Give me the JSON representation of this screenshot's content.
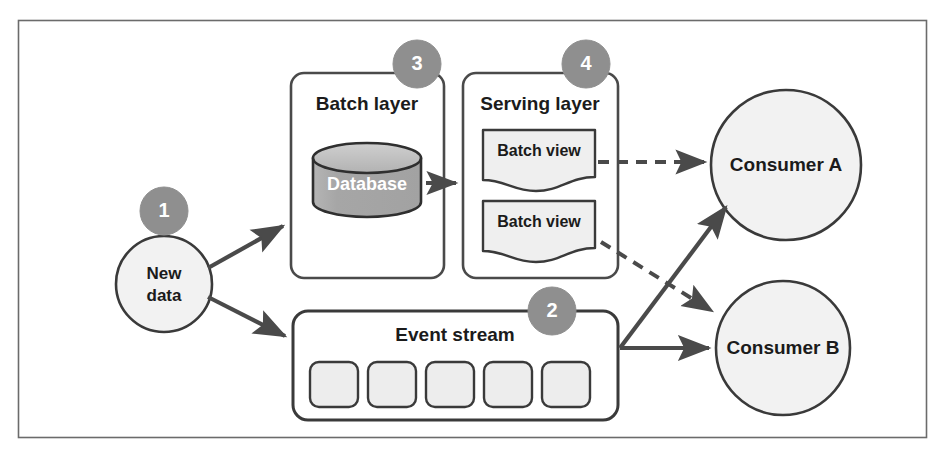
{
  "figure": {
    "type": "architecture-diagram",
    "frame_border_color": "#555555",
    "background_color": "#ffffff"
  },
  "colors": {
    "stroke_dark": "#3a3a3a",
    "stroke_medium": "#555555",
    "badge_fill": "#8f8f8f",
    "badge_text": "#ffffff",
    "database_fill": "#a8a8a8",
    "database_top_fill": "#bdbdbd",
    "database_text": "#ffffff",
    "view_fill": "#efefef",
    "event_box_fill": "#ededed",
    "consumer_fill": "#f2f2f2",
    "new_data_fill": "#f2f2f2",
    "arrow_color": "#4a4a4a",
    "label_text": "#1b1b1b"
  },
  "badges": [
    {
      "id": "badge-1",
      "number": "1",
      "target": "new-data"
    },
    {
      "id": "badge-2",
      "number": "2",
      "target": "event-stream"
    },
    {
      "id": "badge-3",
      "number": "3",
      "target": "batch-layer"
    },
    {
      "id": "badge-4",
      "number": "4",
      "target": "serving-layer"
    }
  ],
  "nodes": {
    "new_data": {
      "label_line1": "New",
      "label_line2": "data",
      "shape": "circle"
    },
    "batch_layer": {
      "title": "Batch layer",
      "shape": "rounded-rect",
      "database": {
        "label": "Database",
        "shape": "cylinder"
      }
    },
    "serving_layer": {
      "title": "Serving layer",
      "shape": "rounded-rect",
      "views": [
        {
          "label": "Batch view",
          "shape": "wavy-document"
        },
        {
          "label": "Batch view",
          "shape": "wavy-document"
        }
      ]
    },
    "event_stream": {
      "title": "Event stream",
      "shape": "rounded-rect",
      "events": [
        {
          "label": ""
        },
        {
          "label": ""
        },
        {
          "label": ""
        },
        {
          "label": ""
        },
        {
          "label": ""
        }
      ]
    },
    "consumer_a": {
      "label": "Consumer A",
      "shape": "circle"
    },
    "consumer_b": {
      "label": "Consumer B",
      "shape": "circle"
    }
  },
  "edges": [
    {
      "id": "new-data-to-batch-layer",
      "from": "new-data",
      "to": "batch-layer",
      "style": "solid"
    },
    {
      "id": "new-data-to-event-stream",
      "from": "new-data",
      "to": "event-stream",
      "style": "solid"
    },
    {
      "id": "database-to-serving-layer",
      "from": "database",
      "to": "serving-layer",
      "style": "solid"
    },
    {
      "id": "batch-view-1-to-consumer-a",
      "from": "batch-view-1",
      "to": "consumer-a",
      "style": "dashed"
    },
    {
      "id": "batch-view-2-to-consumer-b",
      "from": "batch-view-2",
      "to": "consumer-b",
      "style": "dashed"
    },
    {
      "id": "event-stream-to-consumer-a",
      "from": "event-stream",
      "to": "consumer-a",
      "style": "solid"
    },
    {
      "id": "event-stream-to-consumer-b",
      "from": "event-stream",
      "to": "consumer-b",
      "style": "solid"
    }
  ]
}
